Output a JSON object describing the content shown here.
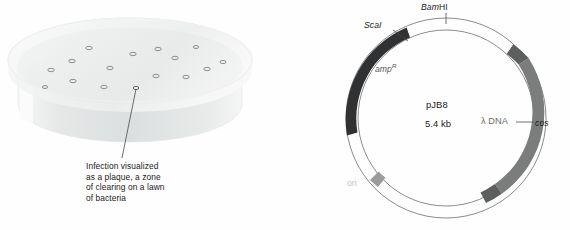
{
  "figure": {
    "width": 570,
    "height": 230,
    "background": "#fefefe"
  },
  "panels": {
    "left": {
      "name": "petri-dish-plaque-illustration",
      "caption_lines": [
        "Infection visualized",
        "as a plaque, a zone",
        "of clearing on a lawn",
        "of bacteria"
      ],
      "dish": {
        "agar_color": "#c9cdcd",
        "rim_color": "#efefef",
        "wall_color": "#e2e4e4",
        "plaque_ring_color": "#7e8484",
        "plaque_count": 16,
        "leader_line_color": "#4a4a4a"
      }
    },
    "right": {
      "name": "pJB8-cosmid-plasmid-map",
      "labels": {
        "bamhi_italic": "Bam",
        "bamhi_roman": "HI",
        "scai": "ScaI",
        "amp_gene": "amp",
        "amp_superscript": "R",
        "plasmid_name": "pJB8",
        "plasmid_size": "5.4 kb",
        "lambda_dna": "λ DNA",
        "cos": "cos",
        "ori": "ori"
      },
      "colors": {
        "backbone_outline": "#6e6e6e",
        "amp_segment": "#2f3133",
        "lambda_segment": "#7b7d7d",
        "cos_block": "#5d5f5f",
        "ori_block": "#9a9c9c",
        "tick_color": "#4a4a4a"
      },
      "geometry": {
        "center_x": 161,
        "center_y": 118,
        "outer_radius": 100,
        "inner_radius": 88,
        "ring_thickness": 12
      }
    }
  }
}
